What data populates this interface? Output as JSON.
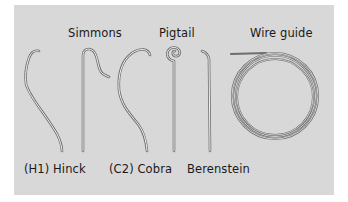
{
  "figure": {
    "background_color": "#d8d8d8",
    "wire_color": "#6e6e6e",
    "labels": {
      "simmons": "Simmons",
      "pigtail": "Pigtail",
      "wire_guide": "Wire guide",
      "hinck": "(H1) Hinck",
      "cobra": "(C2) Cobra",
      "berenstein": "Berenstein"
    }
  }
}
